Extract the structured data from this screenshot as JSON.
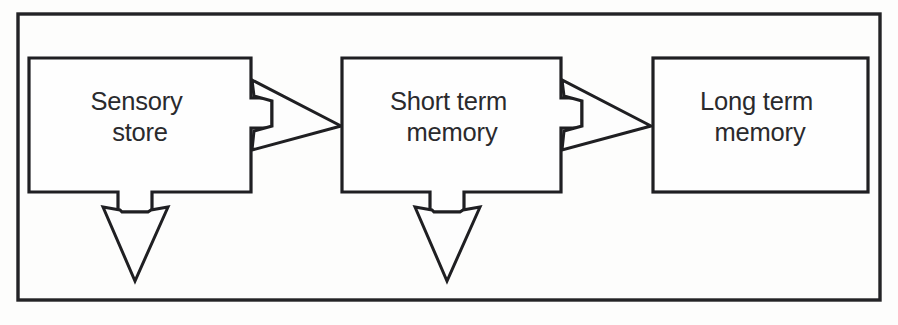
{
  "figure": {
    "background_color": "#fdfdfc",
    "ink_color": "#1f1f22"
  },
  "outer_frame": {
    "name": "figure-border",
    "x": 18,
    "y": 14,
    "width": 862,
    "height": 286
  },
  "boxes": [
    {
      "id": "sensory-store",
      "line1": "Sensory",
      "line2": "store",
      "x": 29,
      "y": 58,
      "width": 222,
      "height": 134,
      "has_right_arrow": true,
      "has_down_arrow": true
    },
    {
      "id": "short-term-memory",
      "line1": "Short term",
      "line2": "memory",
      "x": 342,
      "y": 58,
      "width": 219,
      "height": 134,
      "has_right_arrow": true,
      "has_down_arrow": true
    },
    {
      "id": "long-term-memory",
      "line1": "Long term",
      "line2": "memory",
      "x": 653,
      "y": 58,
      "width": 215,
      "height": 134,
      "has_right_arrow": false,
      "has_down_arrow": false
    }
  ],
  "arrows": [
    {
      "id": "sensory-to-short-term",
      "direction": "right",
      "from": "sensory-store",
      "to": "short-term-memory"
    },
    {
      "id": "short-term-to-long-term",
      "direction": "right",
      "from": "short-term-memory",
      "to": "long-term-memory"
    },
    {
      "id": "sensory-decay-out",
      "direction": "down",
      "from": "sensory-store",
      "to": ""
    },
    {
      "id": "short-term-decay-out",
      "direction": "down",
      "from": "short-term-memory",
      "to": ""
    }
  ]
}
